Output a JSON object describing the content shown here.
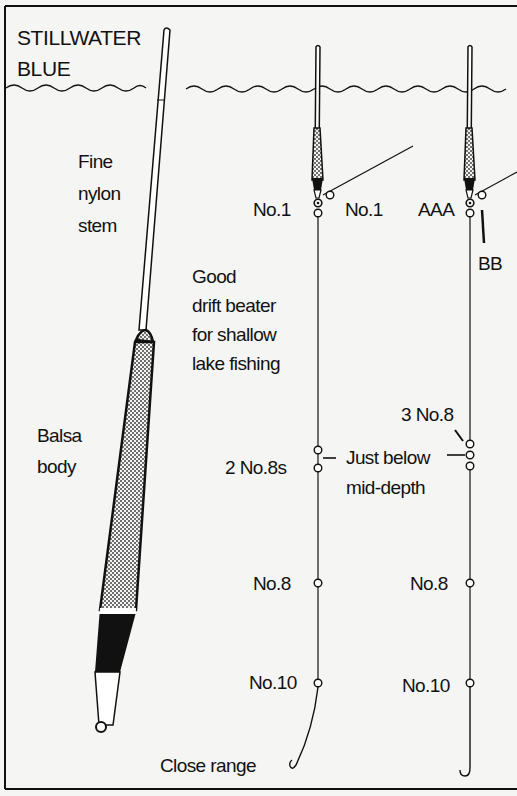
{
  "title": {
    "line1": "STILLWATER",
    "line2": "BLUE"
  },
  "colors": {
    "background": "#f5f5f3",
    "ink": "#111111",
    "stipple": "#d8d8d8"
  },
  "left_float": {
    "stem_label": [
      "Fine",
      "nylon",
      "stem"
    ],
    "body_label": [
      "Balsa",
      "body"
    ]
  },
  "description": [
    "Good",
    "drift beater",
    "for shallow",
    "lake fishing"
  ],
  "rig_close_range": {
    "caption": "Close range",
    "shots": {
      "top_left": "No.1",
      "top_right": "No.1",
      "mid": "2 No.8s",
      "lower": "No.8",
      "bottom": "No.10"
    }
  },
  "rig_second": {
    "shots": {
      "top_left": "AAA",
      "top_right": "BB",
      "mid": "3 No.8",
      "lower": "No.8",
      "bottom": "No.10"
    }
  },
  "depth_note": [
    "Just below",
    "mid-depth"
  ]
}
